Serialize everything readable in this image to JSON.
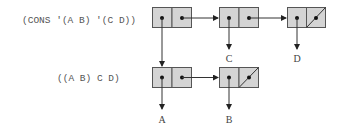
{
  "diagram": {
    "expressions": {
      "input": "(CONS '(A B) '(C D))",
      "result": "((A B) C D)"
    },
    "atoms": {
      "a": "A",
      "b": "B",
      "c": "C",
      "d": "D"
    },
    "colors": {
      "cell_fill": "#d4d4d4",
      "cell_stroke": "#555555",
      "pointer": "#333333",
      "text": "#555555"
    },
    "cells": [
      {
        "id": "cons-new",
        "car": "ptr:(A B)",
        "cdr": "ptr:(C D)",
        "row": 1
      },
      {
        "id": "cd-1",
        "car": "C",
        "cdr": "ptr",
        "row": 1
      },
      {
        "id": "cd-2",
        "car": "D",
        "cdr": "NIL",
        "row": 1
      },
      {
        "id": "ab-1",
        "car": "A",
        "cdr": "ptr",
        "row": 2
      },
      {
        "id": "ab-2",
        "car": "B",
        "cdr": "NIL",
        "row": 2
      }
    ]
  }
}
